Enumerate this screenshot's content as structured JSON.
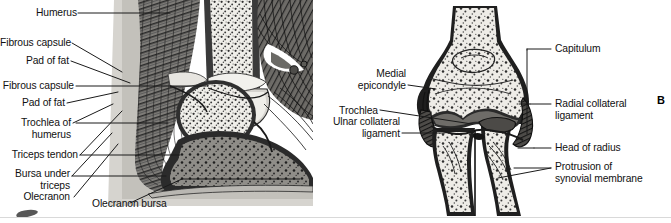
{
  "figure": {
    "panels": [
      {
        "id": "A",
        "letter": "",
        "type": "sagittal-section-elbow",
        "labels_left": [
          {
            "id": "humerus",
            "text": "Humerus"
          },
          {
            "id": "fibrous-capsule-1",
            "text": "Fibrous capsule"
          },
          {
            "id": "pad-of-fat-1",
            "text": "Pad of fat"
          },
          {
            "id": "fibrous-capsule-2",
            "text": "Fibrous capsule"
          },
          {
            "id": "pad-of-fat-2",
            "text": "Pad of fat"
          },
          {
            "id": "trochlea-of-humerus",
            "text": "Trochlea of\nhumerus"
          },
          {
            "id": "triceps-tendon",
            "text": "Triceps tendon"
          },
          {
            "id": "bursa-under-triceps",
            "text": "Bursa under\ntriceps"
          },
          {
            "id": "olecranon",
            "text": "Olecranon"
          }
        ],
        "labels_bottom": [
          {
            "id": "olecranon-bursa",
            "text": "Olecranon bursa"
          }
        ]
      },
      {
        "id": "B",
        "letter": "B",
        "type": "coronal-section-elbow",
        "labels_left": [
          {
            "id": "medial-epicondyle",
            "text": "Medial\nepicondyle"
          },
          {
            "id": "trochlea",
            "text": "Trochlea"
          },
          {
            "id": "ulnar-collateral-ligament",
            "text": "Ulnar collateral\nligament"
          }
        ],
        "labels_right": [
          {
            "id": "capitulum",
            "text": "Capitulum"
          },
          {
            "id": "radial-collateral-ligament",
            "text": "Radial collateral\nligament"
          },
          {
            "id": "head-of-radius",
            "text": "Head of radius"
          },
          {
            "id": "protrusion-of-synovial-membrane",
            "text": "Protrusion of\nsynovial membrane"
          }
        ]
      }
    ]
  },
  "colors": {
    "background": "#ffffff",
    "ink": "#111111",
    "leader_line": "#1a1a1a",
    "bone_fill": "#eceae5",
    "cartilage": "#6f6f6f",
    "muscle_mid": "#8a8a8a",
    "muscle_dark": "#4a4a4a",
    "soft_tissue_light": "#c9c7c2",
    "capsule": "#3b3b3b",
    "footer_rule": "#d9d9d9"
  }
}
